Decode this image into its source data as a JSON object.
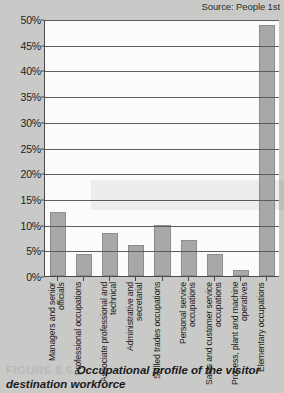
{
  "source": {
    "label": "Source: People 1st"
  },
  "caption": {
    "figure_number": "FIGURE 8.6",
    "text": "Occupational profile of the visitor destination workforce"
  },
  "colors": {
    "page_background": "#c9c9c7",
    "plot_background": "#fbfbfa",
    "bar_fill": "#a8a8a6",
    "bar_stroke": "#8d8d8b",
    "axis": "#4a4a4a",
    "gridline": "#5d5d5d",
    "text": "#1a1a1a",
    "figure_number": "#b9b9b7"
  },
  "chart_data": {
    "type": "bar",
    "title": "Occupational profile of the visitor destination workforce",
    "xlabel": "",
    "ylabel": "",
    "ylim": [
      0,
      50
    ],
    "ytick_labels": [
      "0%",
      "5%",
      "10%",
      "15%",
      "20%",
      "25%",
      "30%",
      "35%",
      "40%",
      "45%",
      "50%"
    ],
    "ytick_values": [
      0,
      5,
      10,
      15,
      20,
      25,
      30,
      35,
      40,
      45,
      50
    ],
    "grid": true,
    "legend": false,
    "categories": [
      "Managers and senior officials",
      "Professional occupations",
      "Associate professional and technical",
      "Administrative and secretarial",
      "Skilled trades occupations",
      "Personal service occupations",
      "Sales and customer service occupations",
      "Process, plant and machine operatives",
      "Elementary occupations"
    ],
    "values": [
      12.5,
      4.2,
      8.3,
      6.0,
      10.0,
      7.0,
      4.3,
      1.2,
      48.8
    ]
  }
}
